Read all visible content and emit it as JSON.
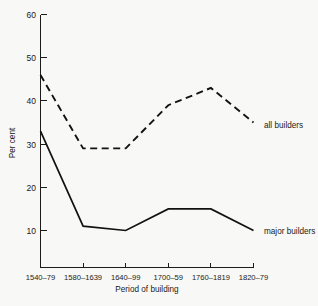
{
  "chart_data": {
    "type": "line",
    "title": "",
    "xlabel": "Period of building",
    "ylabel": "Per cent",
    "categories": [
      "1540–79",
      "1580–1639",
      "1640–99",
      "1700–59",
      "1760–1819",
      "1820–79"
    ],
    "ylim": [
      0,
      60
    ],
    "yticks": [
      10,
      20,
      30,
      40,
      50,
      60
    ],
    "ytick_labels": [
      "10",
      "20",
      "30",
      "40",
      "50",
      "60"
    ],
    "grid": false,
    "legend_position": "inline-right-end-labels",
    "series": [
      {
        "name": "all builders",
        "style": "dashed",
        "values": [
          46,
          29,
          29,
          39,
          43,
          35
        ]
      },
      {
        "name": "major builders",
        "style": "solid",
        "values": [
          33,
          11,
          10,
          15,
          15,
          10
        ]
      }
    ],
    "annotations": [
      {
        "text": "all builders",
        "series": "all builders"
      },
      {
        "text": "major builders",
        "series": "major builders"
      }
    ]
  },
  "axis": {
    "y_label_text": "Per cent",
    "x_label_text": "Period of building"
  },
  "colors": {
    "background": "#f8f8f6",
    "ink": "#121212",
    "axis": "#1c1c1c"
  }
}
